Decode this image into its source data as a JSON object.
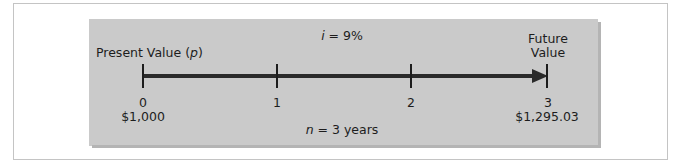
{
  "diagram": {
    "interest_label_var": "i",
    "interest_label_rest": " = 9%",
    "present_value_label_text": "Present Value (",
    "present_value_label_var": "p",
    "present_value_label_close": ")",
    "future_value_label_line1": "Future",
    "future_value_label_line2": "Value",
    "periods_label_var": "n",
    "periods_label_rest": " = 3 years",
    "ticks": [
      {
        "label": "0",
        "value": "$1,000"
      },
      {
        "label": "1",
        "value": ""
      },
      {
        "label": "2",
        "value": ""
      },
      {
        "label": "3",
        "value": "$1,295.03"
      }
    ],
    "colors": {
      "panel": "#cacaca",
      "line": "#2a2a2a",
      "text": "#1d1d1d",
      "frame_border": "#c4c4c4"
    }
  }
}
